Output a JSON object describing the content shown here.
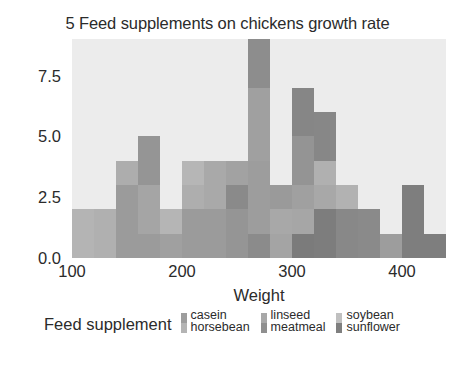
{
  "chart_data": {
    "type": "bar",
    "title": "5 Feed supplements on chickens growth rate",
    "xlabel": "Weight",
    "ylabel": "",
    "xlim": [
      100,
      440
    ],
    "ylim": [
      0,
      9
    ],
    "xticks": [
      100,
      200,
      300,
      400
    ],
    "xticklabels": [
      "100",
      "200",
      "300",
      "400"
    ],
    "yticks": [
      0.0,
      2.5,
      5.0,
      7.5
    ],
    "yticklabels": [
      "0.0",
      "2.5",
      "5.0",
      "7.5"
    ],
    "grid": false,
    "stacked": true,
    "bin_width": 20,
    "bin_starts": [
      100,
      120,
      140,
      160,
      180,
      200,
      220,
      240,
      260,
      280,
      300,
      320,
      340,
      360,
      380,
      400,
      420
    ],
    "legend_title": "Feed supplement",
    "legend_position": "bottom",
    "series": [
      {
        "name": "casein",
        "color": "#9d9d9d",
        "values": [
          0,
          0,
          0,
          0,
          0,
          0,
          0,
          0,
          0,
          1,
          1,
          3,
          2,
          1,
          2,
          1,
          1
        ]
      },
      {
        "name": "horsebean",
        "color": "#b4b4b4",
        "values": [
          2,
          2,
          3,
          1,
          1,
          1,
          0,
          0,
          0,
          0,
          0,
          0,
          0,
          0,
          0,
          0,
          0
        ]
      },
      {
        "name": "linseed",
        "color": "#a8a8a8",
        "values": [
          0,
          0,
          0,
          1,
          2,
          2,
          2,
          1,
          2,
          1,
          1,
          0,
          0,
          0,
          0,
          0,
          0
        ]
      },
      {
        "name": "meatmeal",
        "color": "#8f8f8f",
        "values": [
          0,
          0,
          0,
          0,
          0,
          1,
          0,
          2,
          1,
          0,
          2,
          2,
          1,
          1,
          1,
          0,
          0
        ]
      },
      {
        "name": "soybean",
        "color": "#c0c0c0",
        "values": [
          0,
          0,
          1,
          2,
          1,
          1,
          2,
          1,
          3,
          1,
          1,
          1,
          1,
          0,
          0,
          0,
          0
        ]
      },
      {
        "name": "sunflower",
        "color": "#7f7f7f",
        "values": [
          0,
          0,
          0,
          0,
          0,
          0,
          0,
          0,
          0,
          0,
          2,
          0,
          5,
          3,
          1,
          1,
          0
        ]
      }
    ],
    "bar_columns": [
      {
        "bin_start": 100,
        "bin_end": 120,
        "total": 2,
        "segments": [
          {
            "series": "horsebean",
            "value": 2,
            "color": "#b4b4b4"
          }
        ]
      },
      {
        "bin_start": 120,
        "bin_end": 140,
        "total": 2,
        "segments": [
          {
            "series": "horsebean",
            "value": 2,
            "color": "#b0b0b0"
          }
        ]
      },
      {
        "bin_start": 140,
        "bin_end": 160,
        "total": 4,
        "segments": [
          {
            "series": "horsebean",
            "value": 3,
            "color": "#9b9b9b"
          },
          {
            "series": "soybean",
            "value": 1,
            "color": "#adadad"
          }
        ]
      },
      {
        "bin_start": 160,
        "bin_end": 180,
        "total": 5,
        "segments": [
          {
            "series": "horsebean",
            "value": 1,
            "color": "#9b9b9b"
          },
          {
            "series": "linseed",
            "value": 2,
            "color": "#a5a5a5"
          },
          {
            "series": "soybean",
            "value": 2,
            "color": "#959595"
          }
        ]
      },
      {
        "bin_start": 180,
        "bin_end": 200,
        "total": 2,
        "segments": [
          {
            "series": "horsebean",
            "value": 1,
            "color": "#a0a0a0"
          },
          {
            "series": "soybean",
            "value": 1,
            "color": "#b5b5b5"
          }
        ]
      },
      {
        "bin_start": 200,
        "bin_end": 220,
        "total": 4,
        "segments": [
          {
            "series": "linseed",
            "value": 2,
            "color": "#9b9b9b"
          },
          {
            "series": "meatmeal",
            "value": 1,
            "color": "#aeaeae"
          },
          {
            "series": "soybean",
            "value": 1,
            "color": "#b6b6b6"
          }
        ]
      },
      {
        "bin_start": 220,
        "bin_end": 240,
        "total": 4,
        "segments": [
          {
            "series": "linseed",
            "value": 2,
            "color": "#9b9b9b"
          },
          {
            "series": "soybean",
            "value": 2,
            "color": "#a9a9a9"
          }
        ]
      },
      {
        "bin_start": 240,
        "bin_end": 260,
        "total": 4,
        "segments": [
          {
            "series": "meatmeal",
            "value": 2,
            "color": "#959595"
          },
          {
            "series": "linseed",
            "value": 1,
            "color": "#8a8a8a"
          },
          {
            "series": "soybean",
            "value": 1,
            "color": "#a2a2a2"
          }
        ]
      },
      {
        "bin_start": 260,
        "bin_end": 280,
        "total": 9,
        "segments": [
          {
            "series": "casein",
            "value": 1,
            "color": "#8b8b8b"
          },
          {
            "series": "linseed",
            "value": 3,
            "color": "#9d9d9d"
          },
          {
            "series": "soybean",
            "value": 3,
            "color": "#a0a0a0"
          },
          {
            "series": "meatmeal",
            "value": 2,
            "color": "#8d8d8d"
          }
        ]
      },
      {
        "bin_start": 280,
        "bin_end": 300,
        "total": 3,
        "segments": [
          {
            "series": "casein",
            "value": 1,
            "color": "#a4a4a4"
          },
          {
            "series": "linseed",
            "value": 1,
            "color": "#a8a8a8"
          },
          {
            "series": "soybean",
            "value": 1,
            "color": "#9a9a9a"
          }
        ]
      },
      {
        "bin_start": 300,
        "bin_end": 320,
        "total": 7,
        "segments": [
          {
            "series": "casein",
            "value": 1,
            "color": "#7b7b7b"
          },
          {
            "series": "meatmeal",
            "value": 1,
            "color": "#a6a6a6"
          },
          {
            "series": "linseed",
            "value": 1,
            "color": "#a0a0a0"
          },
          {
            "series": "soybean",
            "value": 2,
            "color": "#949494"
          },
          {
            "series": "sunflower",
            "value": 2,
            "color": "#868686"
          }
        ]
      },
      {
        "bin_start": 320,
        "bin_end": 340,
        "total": 6,
        "segments": [
          {
            "series": "casein",
            "value": 2,
            "color": "#7d7d7d"
          },
          {
            "series": "meatmeal",
            "value": 1,
            "color": "#a8a8a8"
          },
          {
            "series": "soybean",
            "value": 1,
            "color": "#b0b0b0"
          },
          {
            "series": "sunflower",
            "value": 2,
            "color": "#878787"
          }
        ]
      },
      {
        "bin_start": 340,
        "bin_end": 360,
        "total": 3,
        "segments": [
          {
            "series": "sunflower",
            "value": 2,
            "color": "#888888"
          },
          {
            "series": "soybean",
            "value": 1,
            "color": "#b2b2b2"
          }
        ]
      },
      {
        "bin_start": 360,
        "bin_end": 380,
        "total": 2,
        "segments": [
          {
            "series": "sunflower",
            "value": 2,
            "color": "#8a8a8a"
          }
        ]
      },
      {
        "bin_start": 380,
        "bin_end": 400,
        "total": 1,
        "segments": [
          {
            "series": "sunflower",
            "value": 1,
            "color": "#9d9d9d"
          }
        ]
      },
      {
        "bin_start": 400,
        "bin_end": 420,
        "total": 3,
        "segments": [
          {
            "series": "casein",
            "value": 3,
            "color": "#7e7e7e"
          }
        ]
      },
      {
        "bin_start": 420,
        "bin_end": 440,
        "total": 1,
        "segments": [
          {
            "series": "casein",
            "value": 1,
            "color": "#7e7e7e"
          }
        ]
      }
    ]
  },
  "legend": {
    "title": "Feed supplement",
    "columns": [
      {
        "entries": [
          {
            "label": "casein",
            "color": "#9d9d9d"
          },
          {
            "label": "horsebean",
            "color": "#b4b4b4"
          }
        ]
      },
      {
        "entries": [
          {
            "label": "linseed",
            "color": "#a8a8a8"
          },
          {
            "label": "meatmeal",
            "color": "#8f8f8f"
          }
        ]
      },
      {
        "entries": [
          {
            "label": "soybean",
            "color": "#c0c0c0"
          },
          {
            "label": "sunflower",
            "color": "#7f7f7f"
          }
        ]
      }
    ]
  },
  "theme": {
    "panel_background": "#ececec",
    "figure_background": "#ffffff",
    "text_color": "#2b2b2b"
  }
}
